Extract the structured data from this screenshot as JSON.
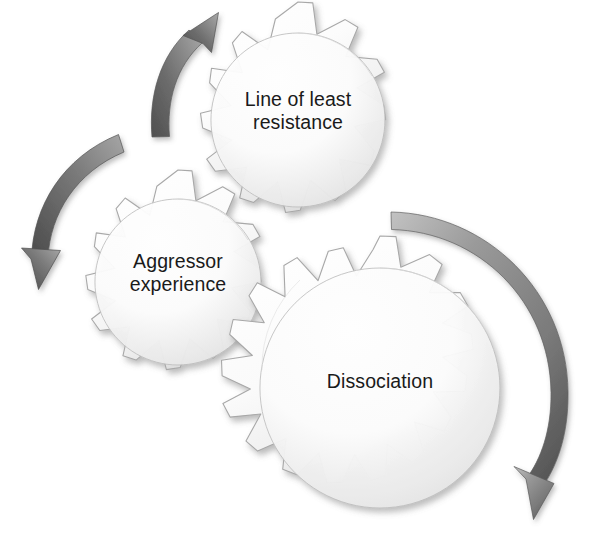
{
  "diagram": {
    "background_color": "#ffffff",
    "gear_fill_light": "#ffffff",
    "gear_fill_shadow": "#d8d8d8",
    "gear_outline_color": "#9a9a9a",
    "arrow_color_dark": "#5f5f5f",
    "arrow_color_light": "#b8b8b8",
    "text_color": "#1a1a1a",
    "nodes": [
      {
        "id": "line-of-least-resistance",
        "label": "Line of least\nresistance",
        "teeth": 9,
        "center_x": 298,
        "center_y": 120,
        "outer_radius": 118,
        "inner_radius": 88
      },
      {
        "id": "aggressor-experience",
        "label": "Aggressor\nexperience",
        "teeth": 9,
        "center_x": 178,
        "center_y": 282,
        "outer_radius": 112,
        "inner_radius": 83
      },
      {
        "id": "dissociation",
        "label": "Dissociation",
        "teeth": 12,
        "center_x": 380,
        "center_y": 388,
        "outer_radius": 152,
        "inner_radius": 120
      }
    ],
    "arrows": [
      {
        "id": "arrow-up-right",
        "description": "curved arrow sweeping upward to the right, arrowhead at top",
        "head_direction": "up-right"
      },
      {
        "id": "arrow-down-left",
        "description": "curved arrow sweeping from upper right down to lower left, arrowhead pointing down",
        "head_direction": "down"
      },
      {
        "id": "arrow-around-right",
        "description": "large curved arrow sweeping clockwise around the right of the big gear, arrowhead at bottom right",
        "head_direction": "down-left"
      }
    ]
  }
}
